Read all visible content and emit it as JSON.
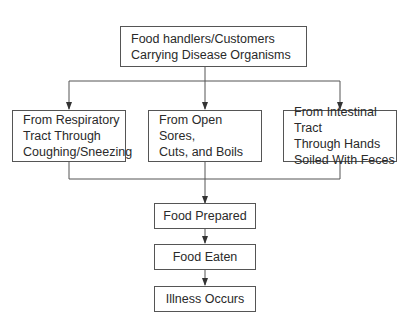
{
  "diagram": {
    "top": {
      "lines": [
        "Food handlers/Customers",
        "Carrying Disease Organisms"
      ]
    },
    "sources": [
      {
        "lines": [
          "From Respiratory",
          "Tract Through",
          "Coughing/Sneezing"
        ]
      },
      {
        "lines": [
          "From Open Sores,",
          "Cuts, and Boils"
        ]
      },
      {
        "lines": [
          "From Intestinal Tract",
          "Through Hands",
          "Soiled With Feces"
        ]
      }
    ],
    "steps": [
      {
        "label": "Food Prepared"
      },
      {
        "label": "Food Eaten"
      },
      {
        "label": "Illness Occurs"
      }
    ],
    "colors": {
      "line": "#555555",
      "text": "#2a2a2a",
      "background": "#ffffff"
    }
  }
}
